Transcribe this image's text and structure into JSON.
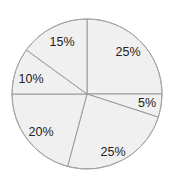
{
  "chart_data": {
    "type": "pie",
    "title": "",
    "legend": "none",
    "categories": [
      "Slice A",
      "Slice B",
      "Slice C",
      "Slice D",
      "Slice E",
      "Slice F"
    ],
    "values": [
      25,
      5,
      25,
      20,
      10,
      15
    ],
    "labels": [
      "25%",
      "5%",
      "25%",
      "20%",
      "10%",
      "15%"
    ],
    "start_angle_deg": 0,
    "direction": "clockwise",
    "drawn_boundaries_deg": [
      0,
      90,
      108,
      195,
      270,
      306,
      360
    ],
    "label_positions": [
      {
        "x": 128,
        "y": 53
      },
      {
        "x": 147,
        "y": 104
      },
      {
        "x": 113,
        "y": 153
      },
      {
        "x": 41,
        "y": 133
      },
      {
        "x": 31,
        "y": 80
      },
      {
        "x": 62,
        "y": 43
      }
    ],
    "center": {
      "x": 87,
      "y": 94
    },
    "radius": 75,
    "colors": {
      "fill": "#f0f0f0",
      "stroke": "#9a9a9a",
      "text": "#222222",
      "background": "#ffffff"
    }
  }
}
